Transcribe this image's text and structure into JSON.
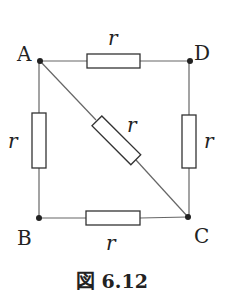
{
  "diagram": {
    "type": "circuit",
    "nodes": [
      {
        "id": "A",
        "label": "A",
        "x": 40,
        "y": 61
      },
      {
        "id": "D",
        "label": "D",
        "x": 190,
        "y": 61
      },
      {
        "id": "B",
        "label": "B",
        "x": 39,
        "y": 218
      },
      {
        "id": "C",
        "label": "C",
        "x": 188,
        "y": 217
      }
    ],
    "resistors": [
      {
        "id": "AD",
        "from": "A",
        "to": "D",
        "label": "r"
      },
      {
        "id": "AB",
        "from": "A",
        "to": "B",
        "label": "r"
      },
      {
        "id": "DC",
        "from": "D",
        "to": "C",
        "label": "r"
      },
      {
        "id": "BC",
        "from": "B",
        "to": "C",
        "label": "r"
      },
      {
        "id": "AC",
        "from": "A",
        "to": "C",
        "label": "r"
      }
    ],
    "caption": "図 6.12",
    "colors": {
      "line": "#555555",
      "node": "#222222",
      "text": "#222222"
    }
  }
}
